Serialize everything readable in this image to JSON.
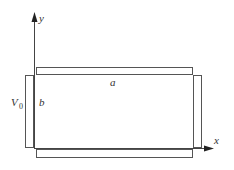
{
  "diagram": {
    "axes": {
      "x_label": "x",
      "y_label": "y"
    },
    "labels": {
      "width": "a",
      "height": "b",
      "potential": "V",
      "potential_subscript": "0"
    },
    "plates": [
      {
        "name": "top-plate"
      },
      {
        "name": "bottom-plate"
      },
      {
        "name": "left-plate"
      },
      {
        "name": "right-plate"
      }
    ]
  }
}
